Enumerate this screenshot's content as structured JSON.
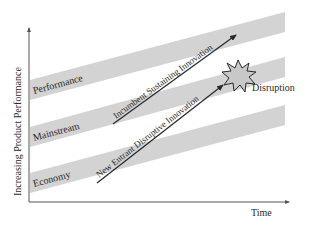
{
  "diagram": {
    "y_axis_label": "Increasing Product Performance",
    "x_axis_label": "Time",
    "bands": [
      {
        "label": "Performance",
        "color": "#d3d3d3"
      },
      {
        "label": "Mainstream",
        "color": "#d3d3d3"
      },
      {
        "label": "Economy",
        "color": "#d3d3d3"
      }
    ],
    "arrows": [
      {
        "label": "Incumbent Sustaining Innovation"
      },
      {
        "label": "New Entrant Disruptive Innovation"
      }
    ],
    "burst_label": "Disruption",
    "colors": {
      "band": "#d3d3d3",
      "burst_fill": "#c8c8c8",
      "line": "#2a2a2a",
      "axis": "#555555"
    }
  }
}
